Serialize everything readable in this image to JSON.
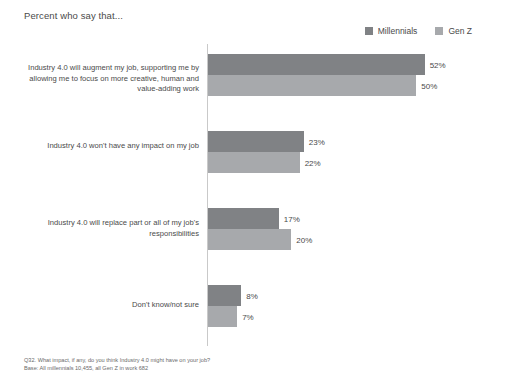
{
  "chart_data": {
    "type": "bar",
    "orientation": "horizontal",
    "title": "Percent who say that...",
    "xlabel": "",
    "ylabel": "",
    "xlim": [
      0,
      60
    ],
    "grid": false,
    "legend_position": "top-right",
    "categories": [
      "Industry 4.0 will augment my job, supporting me by allowing me to focus on more creative, human and value-adding work",
      "Industry 4.0 won't have any impact on my job",
      "Industry 4.0 will replace part or all of my job's responsibilities",
      "Don't know/not sure"
    ],
    "series": [
      {
        "name": "Millennials",
        "color": "#808285",
        "values": [
          52,
          23,
          17,
          8
        ],
        "labels": [
          "52%",
          "23%",
          "17%",
          "8%"
        ]
      },
      {
        "name": "Gen Z",
        "color": "#a7a9ac",
        "values": [
          50,
          22,
          20,
          7
        ],
        "labels": [
          "50%",
          "22%",
          "20%",
          "7%"
        ]
      }
    ],
    "annotations": [
      "Q32. What impact, if any, do you think Industry 4.0 might have on your job?",
      "Base: All millennials 10,455, all Gen Z in work 682"
    ]
  },
  "title": "Percent who say that...",
  "legend": {
    "items": [
      {
        "label": "Millennials",
        "color": "#808285"
      },
      {
        "label": "Gen Z",
        "color": "#a7a9ac"
      }
    ]
  },
  "categories": [
    {
      "label": "Industry 4.0 will augment my job, supporting me by allowing me to focus on more creative, human and value-adding work",
      "millennials": "52%",
      "genz": "50%"
    },
    {
      "label": "Industry 4.0 won't have any impact on my job",
      "millennials": "23%",
      "genz": "22%"
    },
    {
      "label": "Industry 4.0 will replace part or all of my job's responsibilities",
      "millennials": "17%",
      "genz": "20%"
    },
    {
      "label": "Don't know/not sure",
      "millennials": "8%",
      "genz": "7%"
    }
  ],
  "footnote": {
    "question": "Q32. What impact, if any, do you think Industry 4.0 might have on your job?",
    "base": "Base: All millennials 10,455, all Gen Z in work 682"
  },
  "colors": {
    "millennials": "#808285",
    "genz": "#a7a9ac",
    "axis": "#c9c9c9",
    "text": "#4a4a4a",
    "background": "#ffffff"
  }
}
